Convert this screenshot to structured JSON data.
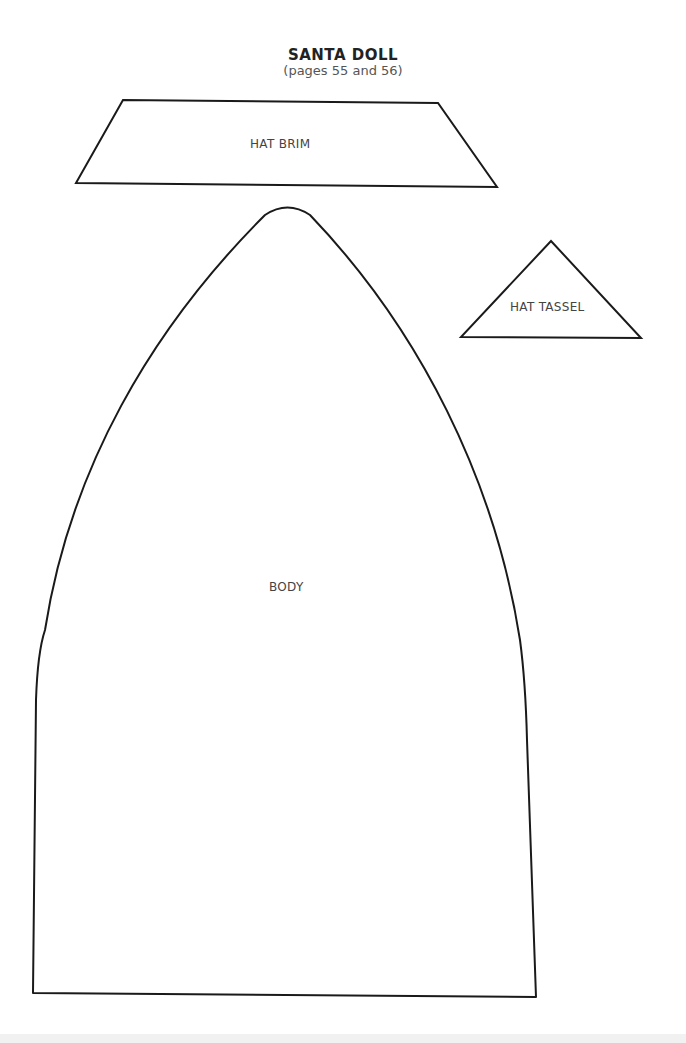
{
  "header": {
    "title": "SANTA DOLL",
    "subtitle": "(pages 55 and 56)"
  },
  "pattern_pieces": [
    {
      "name": "hat-brim",
      "label": "HAT BRIM",
      "shape": "trapezoid"
    },
    {
      "name": "hat-tassel",
      "label": "HAT TASSEL",
      "shape": "triangle"
    },
    {
      "name": "body",
      "label": "BODY",
      "shape": "arch"
    }
  ],
  "colors": {
    "outline": "#1a1a1a",
    "label_text": "#444444",
    "background": "#ffffff"
  }
}
